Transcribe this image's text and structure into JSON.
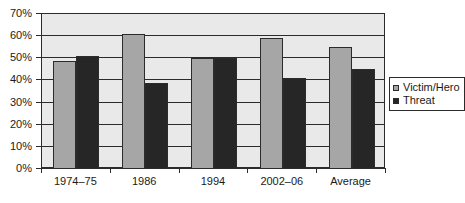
{
  "chart_data": {
    "type": "bar",
    "title": "",
    "subtitle": "",
    "xlabel": "",
    "ylabel": "",
    "categories": [
      "1974–75",
      "1986",
      "1994",
      "2002–06",
      "Average"
    ],
    "series": [
      {
        "name": "Victim/Hero",
        "values": [
          49,
          61,
          50,
          59,
          55
        ],
        "color": "#a6a6a6"
      },
      {
        "name": "Threat",
        "values": [
          51,
          39,
          50,
          41,
          45
        ],
        "color": "#262626"
      }
    ],
    "ylim": [
      0,
      70
    ],
    "ytick_values": [
      0,
      10,
      20,
      30,
      40,
      50,
      60,
      70
    ],
    "ytick_labels": [
      "0%",
      "10%",
      "20%",
      "30%",
      "40%",
      "50%",
      "60%",
      "70%"
    ],
    "grid": true,
    "grid_axis": "y",
    "legend_position": "right",
    "value_format": "percent",
    "plot_background": "#e9e9e9",
    "axis_color": "#2b2b2b"
  },
  "legend": {
    "items": [
      {
        "label": "Victim/Hero",
        "marker": "square-light-gray"
      },
      {
        "label": "Threat",
        "marker": "square-dark"
      }
    ]
  }
}
